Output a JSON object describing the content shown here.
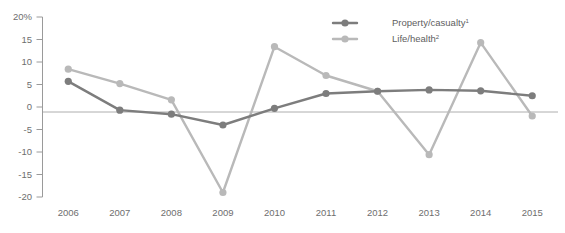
{
  "chart_data": {
    "type": "line",
    "title": "",
    "xlabel": "",
    "ylabel": "",
    "ylim": [
      -20,
      20
    ],
    "grid": false,
    "legend_position": "top-right",
    "x": [
      "2006",
      "2007",
      "2008",
      "2009",
      "2010",
      "2011",
      "2012",
      "2013",
      "2014",
      "2015"
    ],
    "categories": [
      "2006",
      "2007",
      "2008",
      "2009",
      "2010",
      "2011",
      "2012",
      "2013",
      "2014",
      "2015"
    ],
    "y_ticks": [
      "20%",
      "15",
      "10",
      "5",
      "0",
      "-5",
      "-10",
      "-15",
      "-20"
    ],
    "y_tick_values": [
      20,
      15,
      10,
      5,
      0,
      -5,
      -10,
      -15,
      -20
    ],
    "series": [
      {
        "name": "Property/casualty",
        "footnote": "1",
        "color": "#7d7d7d",
        "values": [
          5.7,
          -0.7,
          -1.6,
          -4.0,
          -0.3,
          3.0,
          3.5,
          3.8,
          3.6,
          2.5
        ]
      },
      {
        "name": "Life/health",
        "footnote": "2",
        "color": "#b9b9b9",
        "values": [
          8.4,
          5.2,
          1.6,
          -19.0,
          13.4,
          7.0,
          3.5,
          -10.6,
          14.3,
          -2.0
        ]
      }
    ]
  },
  "legend": {
    "items": [
      {
        "label": "Property/casualty",
        "sup": "1",
        "color": "#7d7d7d"
      },
      {
        "label": "Life/health",
        "sup": "2",
        "color": "#b9b9b9"
      }
    ]
  },
  "colors": {
    "property_casualty": "#7d7d7d",
    "life_health": "#b9b9b9",
    "axis": "#9a9a9a",
    "text": "#6e6e6e",
    "background": "#ffffff"
  }
}
